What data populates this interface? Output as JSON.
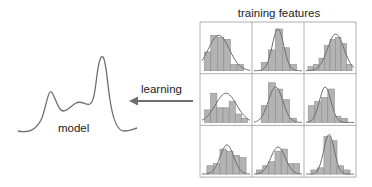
{
  "labels": {
    "title": "training features",
    "arrow": "learning",
    "model": "model"
  },
  "colors": {
    "bar_fill": "#b3b3b3",
    "bar_stroke": "#8c8c8c",
    "curve": "#6e6e6e",
    "grid": "#9a9a9a",
    "arrow": "#6e6e6e",
    "text": "#222222"
  },
  "grid": {
    "rows": 3,
    "cols": 3,
    "cells": [
      {
        "bars": [
          0.45,
          0.85,
          0.8,
          0.75,
          0.15,
          0.15
        ],
        "peak": 0.35,
        "width": 0.22,
        "height": 0.85
      },
      {
        "bars": [
          0.2,
          0.5,
          1.0,
          0.55,
          0.15
        ],
        "peak": 0.5,
        "width": 0.12,
        "height": 1.0
      },
      {
        "bars": [
          0.1,
          0.15,
          0.3,
          0.6,
          0.75,
          0.8,
          0.65,
          0.15
        ],
        "peak": 0.62,
        "width": 0.17,
        "height": 0.88
      },
      {
        "bars": [
          0.3,
          0.7,
          0.35,
          0.35,
          0.5,
          0.2,
          0.1
        ],
        "peak": 0.5,
        "width": 0.22,
        "height": 0.7
      },
      {
        "bars": [
          0.4,
          0.95,
          0.8,
          0.55,
          0.1
        ],
        "peak": 0.45,
        "width": 0.15,
        "height": 0.85
      },
      {
        "bars": [
          0.4,
          0.5,
          0.6,
          0.8,
          0.15,
          0.1
        ],
        "peak": 0.4,
        "width": 0.12,
        "height": 0.85
      },
      {
        "bars": [
          0.2,
          0.25,
          0.6,
          0.55,
          0.45,
          0.4
        ],
        "peak": 0.52,
        "width": 0.14,
        "height": 0.7
      },
      {
        "bars": [
          0.1,
          0.2,
          0.3,
          0.55,
          0.6,
          0.25,
          0.25
        ],
        "peak": 0.5,
        "width": 0.15,
        "height": 0.65
      },
      {
        "bars": [
          0.1,
          0.15,
          0.9,
          0.8,
          0.2,
          0.1
        ],
        "peak": 0.48,
        "width": 0.11,
        "height": 0.95
      }
    ]
  }
}
